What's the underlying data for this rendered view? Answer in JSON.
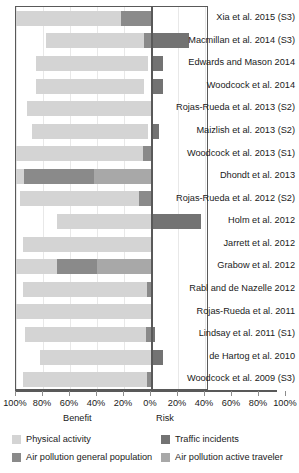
{
  "chart_data": {
    "type": "bar",
    "subtype": "diverging-stacked-horizontal",
    "title": "",
    "xlabel_left": "Benefit",
    "xlabel_right": "Risk",
    "ylabel": "",
    "grid": true,
    "legend_position": "bottom",
    "axis": {
      "left_ticks": [
        "100%",
        "80%",
        "60%",
        "40%",
        "20%"
      ],
      "center_tick": "0%",
      "right_ticks": [
        "20%",
        "40%",
        "60%",
        "80%",
        "100%"
      ],
      "all_tick_labels": [
        "100%",
        "80%",
        "60%",
        "40%",
        "20%",
        "0%",
        "20%",
        "40%",
        "60%",
        "80%",
        "100%"
      ],
      "left_range": [
        100,
        0
      ],
      "right_range": [
        0,
        100
      ],
      "tick_step": 20
    },
    "series": [
      {
        "name": "Physical activity",
        "color": "#d4d4d4",
        "side": "benefit"
      },
      {
        "name": "Traffic incidents",
        "color": "#737373",
        "side": "risk"
      },
      {
        "name": "Air pollution general population",
        "color": "#8a8a8a",
        "side": "both"
      },
      {
        "name": "Air pollution active traveler",
        "color": "#a8a8a8",
        "side": "risk"
      }
    ],
    "categories": [
      "Xia et al. 2015 (S3)",
      "Macmillan et al. 2014 (S3)",
      "Edwards and Mason 2014",
      "Woodcock et al. 2014",
      "Rojas-Rueda et al. 2013 (S2)",
      "Maizlish et al. 2013 (S2)",
      "Woodcock et al. 2013 (S1)",
      "Dhondt et al. 2013",
      "Rojas-Rueda et al. 2012 (S2)",
      "Holm et al. 2012",
      "Jarrett et al. 2012",
      "Grabow et al. 2012",
      "Rabl and de Nazelle 2012",
      "Rojas-Rueda et al. 2011",
      "Lindsay et al. 2011 (S1)",
      "de Hartog et al. 2010",
      "Woodcock et al. 2009 (S3)"
    ],
    "rows": [
      {
        "label": "Xia et al. 2015 (S3)",
        "benefit": [
          {
            "series": "Physical activity",
            "from": 100,
            "to": 22
          },
          {
            "series": "Air pollution general population",
            "from": 22,
            "to": 0
          }
        ],
        "risk": []
      },
      {
        "label": "Macmillan et al. 2014 (S3)",
        "benefit": [
          {
            "series": "Physical activity",
            "from": 78,
            "to": 5
          },
          {
            "series": "Air pollution general population",
            "from": 5,
            "to": 0
          }
        ],
        "risk": [
          {
            "series": "Traffic incidents",
            "from": 0,
            "to": 28
          }
        ]
      },
      {
        "label": "Edwards and Mason 2014",
        "benefit": [
          {
            "series": "Physical activity",
            "from": 85,
            "to": 2
          }
        ],
        "risk": [
          {
            "series": "Traffic incidents",
            "from": 0,
            "to": 9
          }
        ]
      },
      {
        "label": "Woodcock et al. 2014",
        "benefit": [
          {
            "series": "Physical activity",
            "from": 85,
            "to": 5
          }
        ],
        "risk": [
          {
            "series": "Traffic incidents",
            "from": 0,
            "to": 9
          }
        ]
      },
      {
        "label": "Rojas-Rueda et al. 2013 (S2)",
        "benefit": [
          {
            "series": "Physical activity",
            "from": 92,
            "to": 0
          }
        ],
        "risk": []
      },
      {
        "label": "Maizlish et al. 2013 (S2)",
        "benefit": [
          {
            "series": "Physical activity",
            "from": 88,
            "to": 2
          }
        ],
        "risk": [
          {
            "series": "Traffic incidents",
            "from": 0,
            "to": 6
          }
        ]
      },
      {
        "label": "Woodcock et al. 2013 (S1)",
        "benefit": [
          {
            "series": "Physical activity",
            "from": 100,
            "to": 6
          },
          {
            "series": "Air pollution general population",
            "from": 6,
            "to": 0
          }
        ],
        "risk": []
      },
      {
        "label": "Dhondt et al. 2013",
        "benefit": [
          {
            "series": "Physical activity",
            "from": 100,
            "to": 94
          },
          {
            "series": "Air pollution general population",
            "from": 94,
            "to": 42
          },
          {
            "series": "Air pollution active traveler",
            "from": 42,
            "to": 0
          }
        ],
        "risk": []
      },
      {
        "label": "Rojas-Rueda et al. 2012 (S2)",
        "benefit": [
          {
            "series": "Physical activity",
            "from": 97,
            "to": 9
          },
          {
            "series": "Air pollution general population",
            "from": 9,
            "to": 0
          }
        ],
        "risk": []
      },
      {
        "label": "Holm et al. 2012",
        "benefit": [
          {
            "series": "Physical activity",
            "from": 70,
            "to": 0
          }
        ],
        "risk": [
          {
            "series": "Traffic incidents",
            "from": 0,
            "to": 37
          }
        ]
      },
      {
        "label": "Jarrett et al. 2012",
        "benefit": [
          {
            "series": "Physical activity",
            "from": 95,
            "to": 0
          }
        ],
        "risk": []
      },
      {
        "label": "Grabow et al. 2012",
        "benefit": [
          {
            "series": "Physical activity",
            "from": 100,
            "to": 70
          },
          {
            "series": "Air pollution general population",
            "from": 70,
            "to": 40
          },
          {
            "series": "Air pollution active traveler",
            "from": 40,
            "to": 0
          }
        ],
        "risk": []
      },
      {
        "label": "Rabl and de Nazelle 2012",
        "benefit": [
          {
            "series": "Physical activity",
            "from": 95,
            "to": 3
          },
          {
            "series": "Air pollution general population",
            "from": 3,
            "to": 0
          }
        ],
        "risk": []
      },
      {
        "label": "Rojas-Rueda et al. 2011",
        "benefit": [
          {
            "series": "Physical activity",
            "from": 100,
            "to": 0
          }
        ],
        "risk": []
      },
      {
        "label": "Lindsay et al. 2011 (S1)",
        "benefit": [
          {
            "series": "Physical activity",
            "from": 93,
            "to": 4
          },
          {
            "series": "Air pollution general population",
            "from": 4,
            "to": 0
          }
        ],
        "risk": [
          {
            "series": "Traffic incidents",
            "from": 0,
            "to": 3
          }
        ]
      },
      {
        "label": "de Hartog et al. 2010",
        "benefit": [
          {
            "series": "Physical activity",
            "from": 82,
            "to": 0
          }
        ],
        "risk": [
          {
            "series": "Traffic incidents",
            "from": 0,
            "to": 9
          }
        ]
      },
      {
        "label": "Woodcock et al. 2009 (S3)",
        "benefit": [
          {
            "series": "Physical activity",
            "from": 95,
            "to": 3
          },
          {
            "series": "Air pollution general population",
            "from": 3,
            "to": 0
          }
        ],
        "risk": []
      }
    ]
  },
  "legend": {
    "items": [
      {
        "label": "Physical activity",
        "color": "#d4d4d4"
      },
      {
        "label": "Traffic incidents",
        "color": "#737373"
      },
      {
        "label": "Air pollution general population",
        "color": "#8a8a8a"
      },
      {
        "label": "Air pollution active traveler",
        "color": "#a8a8a8"
      }
    ]
  }
}
